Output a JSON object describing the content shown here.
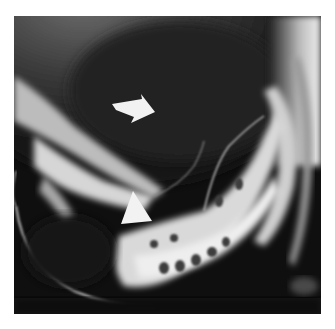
{
  "image": {
    "kind": "radiograph",
    "description": "Grayscale barium contrast X-ray with two white arrow annotations",
    "annotations": [
      {
        "type": "arrow",
        "direction": "down-left",
        "name": "block-arrow"
      },
      {
        "type": "arrowhead",
        "direction": "up",
        "name": "triangle-arrowhead"
      }
    ],
    "colors": {
      "background": "#ffffff",
      "film_dark": "#0d0d0d",
      "film_mid": "#5a5a5a",
      "contrast_bright": "#e8e8e8",
      "annotation": "#f2f2f2"
    }
  }
}
